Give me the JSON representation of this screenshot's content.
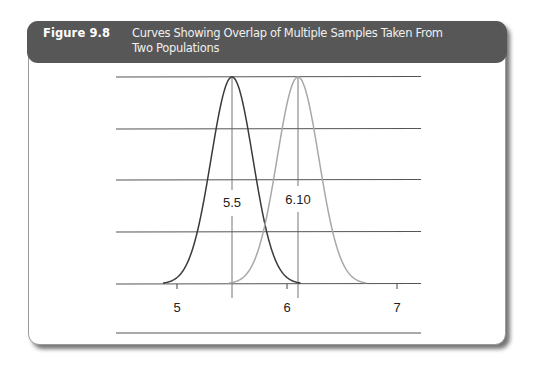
{
  "figure": {
    "label": "Figure 9.8",
    "title": "Curves Showing Overlap of Multiple Samples Taken From Two Populations"
  },
  "colors": {
    "header_bg": "#575757",
    "curve_1": "#3a3a3a",
    "curve_2": "#a8a8a8",
    "gridline": "#555555"
  },
  "chart_data": {
    "type": "line",
    "title": "Curves Showing Overlap of Multiple Samples Taken From Two Populations",
    "xlabel": "",
    "ylabel": "",
    "xlim": [
      4.45,
      7.3
    ],
    "x_ticks": [
      5,
      6,
      7
    ],
    "x_tick_labels": [
      "5",
      "6",
      "7"
    ],
    "grid": "horizontal lines",
    "legend": null,
    "series": [
      {
        "name": "Sample distribution 1",
        "distribution": "normal",
        "mean": 5.5,
        "sd": 0.19,
        "color": "#3a3a3a",
        "annotation": "5.5"
      },
      {
        "name": "Sample distribution 2",
        "distribution": "normal",
        "mean": 6.1,
        "sd": 0.19,
        "color": "#a8a8a8",
        "annotation": "6.10"
      }
    ],
    "annotations": [
      "5.5",
      "6.10"
    ]
  }
}
